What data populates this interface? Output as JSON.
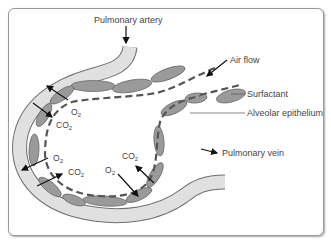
{
  "diagram": {
    "labels": {
      "pulmonary_artery": "Pulmonary artery",
      "air_flow": "Air flow",
      "surfactant": "Surfactant",
      "alveolar_epithelium": "Alveolar epithelium",
      "pulmonary_vein": "Pulmonary vein"
    },
    "gases": {
      "o2": "O",
      "co2": "CO",
      "subscript": "2"
    },
    "colors": {
      "vessel_fill": "#e0e0e0",
      "vessel_stroke": "#6f6f6f",
      "cell_fill": "#9a9a9a",
      "cell_stroke": "#6a6a6a",
      "surfactant_dash": "#555555",
      "arrow": "#111111",
      "frame": "#9a9a9a"
    }
  }
}
